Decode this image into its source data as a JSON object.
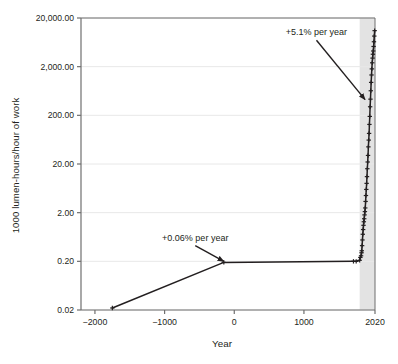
{
  "figure": {
    "name": "light-price-history-chart",
    "background": "#ffffff",
    "ink_color": "#231f20",
    "grid_color": "#e8e8e8",
    "axis_color": "#6f6f6f",
    "band_color": "#d9d9d9"
  },
  "chart_data": {
    "type": "line",
    "title": "",
    "xlabel": "Year",
    "ylabel": "1000 lumen-hours/hour of work",
    "yscale": "log",
    "xscale": "linear",
    "xlim": [
      -2200,
      2020
    ],
    "ylim": [
      0.02,
      20000
    ],
    "grid": true,
    "legend": false,
    "y_ticks": [
      0.02,
      0.2,
      2.0,
      20.0,
      200.0,
      2000.0,
      20000.0
    ],
    "y_tick_labels": [
      "0.02",
      "0.20",
      "2.00",
      "20.00",
      "200.00",
      "2,000.00",
      "20,000.00"
    ],
    "x_ticks": [
      -2000,
      -1000,
      0,
      1000,
      2020
    ],
    "x_tick_labels": [
      "−2000",
      "−1000",
      "0",
      "1000",
      "2020"
    ],
    "shaded_band": {
      "x_start": 1800,
      "x_end": 2020,
      "label": ""
    },
    "series": [
      {
        "name": "Light price (labour-time cost of light)",
        "marker": "plus",
        "color": "#231f20",
        "points": [
          {
            "x": -1750,
            "y": 0.022
          },
          {
            "x": -150,
            "y": 0.19
          },
          {
            "x": 1711,
            "y": 0.2
          },
          {
            "x": 1750,
            "y": 0.2
          },
          {
            "x": 1800,
            "y": 0.21
          },
          {
            "x": 1810,
            "y": 0.24
          },
          {
            "x": 1820,
            "y": 0.26
          },
          {
            "x": 1827,
            "y": 0.3
          },
          {
            "x": 1830,
            "y": 0.33
          },
          {
            "x": 1835,
            "y": 0.42
          },
          {
            "x": 1840,
            "y": 0.55
          },
          {
            "x": 1845,
            "y": 0.72
          },
          {
            "x": 1850,
            "y": 0.9
          },
          {
            "x": 1855,
            "y": 1.1
          },
          {
            "x": 1860,
            "y": 1.3
          },
          {
            "x": 1865,
            "y": 1.5
          },
          {
            "x": 1870,
            "y": 1.8
          },
          {
            "x": 1875,
            "y": 2.1
          },
          {
            "x": 1880,
            "y": 2.5
          },
          {
            "x": 1885,
            "y": 3.4
          },
          {
            "x": 1890,
            "y": 4.5
          },
          {
            "x": 1895,
            "y": 6.0
          },
          {
            "x": 1900,
            "y": 8.0
          },
          {
            "x": 1905,
            "y": 11.0
          },
          {
            "x": 1910,
            "y": 16.0
          },
          {
            "x": 1915,
            "y": 22.0
          },
          {
            "x": 1920,
            "y": 30.0
          },
          {
            "x": 1925,
            "y": 45.0
          },
          {
            "x": 1930,
            "y": 62.0
          },
          {
            "x": 1935,
            "y": 85.0
          },
          {
            "x": 1940,
            "y": 130.0
          },
          {
            "x": 1945,
            "y": 190.0
          },
          {
            "x": 1950,
            "y": 300.0
          },
          {
            "x": 1955,
            "y": 430.0
          },
          {
            "x": 1960,
            "y": 640.0
          },
          {
            "x": 1965,
            "y": 950.0
          },
          {
            "x": 1970,
            "y": 1350.0
          },
          {
            "x": 1975,
            "y": 1800.0
          },
          {
            "x": 1980,
            "y": 2400.0
          },
          {
            "x": 1985,
            "y": 3000.0
          },
          {
            "x": 1990,
            "y": 3600.0
          },
          {
            "x": 1995,
            "y": 4200.0
          },
          {
            "x": 2000,
            "y": 5200.0
          },
          {
            "x": 2005,
            "y": 6500.0
          },
          {
            "x": 2010,
            "y": 8500.0
          },
          {
            "x": 2015,
            "y": 11000.0
          }
        ]
      }
    ],
    "annotations": [
      {
        "id": "growth-modern",
        "text": "+5.1% per year",
        "text_x": 1180,
        "text_y": 7000,
        "arrow_to_x": 1878,
        "arrow_to_y": 420
      },
      {
        "id": "growth-ancient",
        "text": "+0.06% per year",
        "text_x": -560,
        "text_y": 0.42,
        "arrow_to_x": -150,
        "arrow_to_y": 0.2
      }
    ]
  }
}
